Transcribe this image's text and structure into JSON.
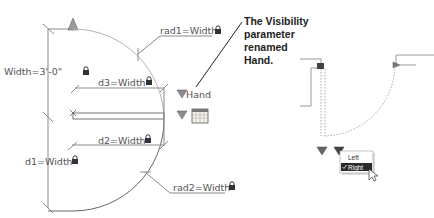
{
  "block_editor": {
    "width_param": "Width=3'-0\"",
    "rad1_param": "rad1=Width",
    "rad2_param": "rad2=Width",
    "d1_param": "d1=Width",
    "d2_param": "d2=Width",
    "d3_param": "d3=Width",
    "visibility_label": "Hand",
    "lock_icon": "lock-icon",
    "grip_icons": [
      "linear-grip-icon",
      "visibility-grip-icon",
      "lookup-grip-icon",
      "lookup-table-icon"
    ]
  },
  "callout": {
    "lines": [
      "The Visibility",
      "parameter",
      "renamed",
      "Hand."
    ]
  },
  "preview": {
    "menu_items": [
      {
        "label": "Left",
        "checked": false
      },
      {
        "label": "Right",
        "checked": true
      }
    ],
    "check_icon": "checkmark-icon",
    "cursor_icon": "pointer-cursor-icon"
  },
  "colors": {
    "line": "#8a8a8a",
    "arc": "#a8a8a8",
    "grip": "#8c8c8c",
    "menu_bg": "#ffffff",
    "menu_selected": "#2b2b2b"
  }
}
